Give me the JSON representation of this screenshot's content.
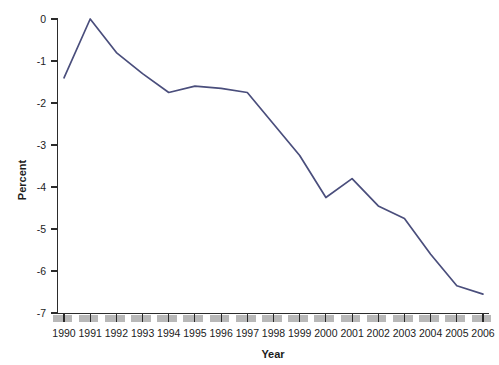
{
  "chart_data": {
    "type": "line",
    "title": "",
    "xlabel": "Year",
    "ylabel": "Percent",
    "x": [
      1990,
      1991,
      1992,
      1993,
      1994,
      1995,
      1996,
      1997,
      1998,
      1999,
      2000,
      2001,
      2002,
      2003,
      2004,
      2005,
      2006
    ],
    "categories": [
      "1990",
      "1991",
      "1992",
      "1993",
      "1994",
      "1995",
      "1996",
      "1997",
      "1998",
      "1999",
      "2000",
      "2001",
      "2002",
      "2003",
      "2004",
      "2005",
      "2006"
    ],
    "values": [
      -1.4,
      0.0,
      -0.8,
      -1.3,
      -1.75,
      -1.6,
      -1.65,
      -1.75,
      -2.5,
      -3.25,
      -4.25,
      -3.8,
      -4.45,
      -4.75,
      -5.6,
      -6.35,
      -6.55
    ],
    "series": [
      {
        "name": "Percent",
        "color": "#4a4e7c",
        "values": [
          -1.4,
          0.0,
          -0.8,
          -1.3,
          -1.75,
          -1.6,
          -1.65,
          -1.75,
          -2.5,
          -3.25,
          -4.25,
          -3.8,
          -4.45,
          -4.75,
          -5.6,
          -6.35,
          -6.55
        ]
      }
    ],
    "ylim": [
      -7,
      0
    ],
    "xlim": [
      1990,
      2006
    ],
    "ytick_labels": [
      "0",
      "-1",
      "-2",
      "-3",
      "-4",
      "-5",
      "-6",
      "-7"
    ],
    "ytick_values": [
      0,
      -1,
      -2,
      -3,
      -4,
      -5,
      -6,
      -7
    ],
    "grid": false,
    "legend": false,
    "legend_position": "none",
    "line_color": "#4a4e7c",
    "axis_color": "#2b2b2b",
    "background_color": "#ffffff",
    "xaxis_block_color": "#b8b8b8"
  }
}
